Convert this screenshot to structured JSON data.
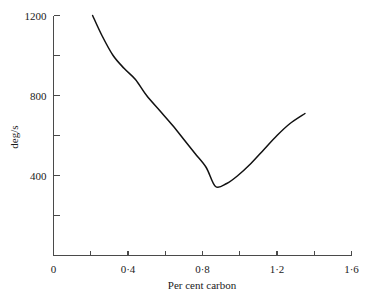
{
  "chart_data": {
    "type": "line",
    "title": "",
    "subtitle": "",
    "xlabel": "Per cent carbon",
    "ylabel": "deg/s",
    "xlim": [
      0,
      1.6
    ],
    "ylim": [
      0,
      1200
    ],
    "grid": false,
    "legend": null,
    "x_ticks": [
      {
        "value": 0,
        "label": "0"
      },
      {
        "value": 0.2,
        "label": ""
      },
      {
        "value": 0.4,
        "label": "0·4"
      },
      {
        "value": 0.6,
        "label": ""
      },
      {
        "value": 0.8,
        "label": "0·8"
      },
      {
        "value": 1.0,
        "label": ""
      },
      {
        "value": 1.2,
        "label": "1·2"
      },
      {
        "value": 1.4,
        "label": ""
      },
      {
        "value": 1.6,
        "label": "1·6"
      }
    ],
    "y_ticks": [
      {
        "value": 0,
        "label": ""
      },
      {
        "value": 200,
        "label": ""
      },
      {
        "value": 400,
        "label": "400"
      },
      {
        "value": 600,
        "label": ""
      },
      {
        "value": 800,
        "label": "800"
      },
      {
        "value": 1000,
        "label": ""
      },
      {
        "value": 1200,
        "label": "1200"
      }
    ],
    "series": [
      {
        "name": "deg/s vs per cent carbon",
        "color": "#111111",
        "x": [
          0.21,
          0.26,
          0.32,
          0.38,
          0.44,
          0.5,
          0.57,
          0.64,
          0.7,
          0.76,
          0.82,
          0.87,
          0.93,
          0.99,
          1.06,
          1.13,
          1.2,
          1.27,
          1.35
        ],
        "y": [
          1200,
          1100,
          1000,
          935,
          880,
          800,
          725,
          650,
          580,
          510,
          440,
          345,
          360,
          400,
          460,
          530,
          600,
          660,
          710
        ]
      }
    ]
  },
  "axes": {
    "y_axis_label": "deg/s",
    "x_axis_label": "Per cent carbon"
  },
  "colors": {
    "curve": "#111111",
    "axis": "#4a4a4a",
    "text": "#1a1a1a",
    "background": "#ffffff"
  }
}
